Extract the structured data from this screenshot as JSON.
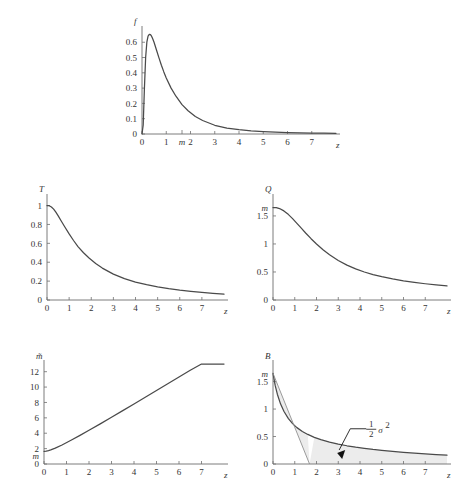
{
  "header": {
    "running_head": "",
    "page_number": ""
  },
  "figure": {
    "caption": "",
    "panels": [
      "f",
      "T",
      "Q",
      "m-bar",
      "B"
    ]
  },
  "chart_data": [
    {
      "type": "line",
      "id": "panel-f",
      "title": "",
      "ylabel": "f",
      "xlabel": "z",
      "xlim": [
        0,
        8
      ],
      "ylim": [
        0,
        0.68
      ],
      "grid": false,
      "legend": null,
      "xticks": [
        0,
        1,
        2,
        3,
        4,
        5,
        6,
        7
      ],
      "xticklabels": [
        "0",
        "1",
        "2",
        "3",
        "4",
        "5",
        "6",
        "7"
      ],
      "yticks": [
        0,
        0.1,
        0.2,
        0.3,
        0.4,
        0.5,
        0.6
      ],
      "yticklabels": [
        "0",
        "0.1",
        "0.2",
        "0.3",
        "0.4",
        "0.5",
        "0.6"
      ],
      "annotations": [
        {
          "text": "m",
          "x": 1.65,
          "y": 0,
          "place": "x-axis"
        }
      ],
      "series": [
        {
          "name": "f(z)",
          "x": [
            0.0,
            0.05,
            0.1,
            0.15,
            0.2,
            0.25,
            0.3,
            0.35,
            0.4,
            0.45,
            0.5,
            0.6,
            0.7,
            0.8,
            0.9,
            1.0,
            1.2,
            1.4,
            1.65,
            1.9,
            2.2,
            2.5,
            3.0,
            3.5,
            4.0,
            4.5,
            5.0,
            5.5,
            6.0,
            6.5,
            7.0,
            7.5,
            8.0
          ],
          "y": [
            0.0,
            0.06,
            0.3,
            0.5,
            0.6,
            0.64,
            0.652,
            0.65,
            0.638,
            0.62,
            0.598,
            0.548,
            0.498,
            0.45,
            0.406,
            0.366,
            0.3,
            0.247,
            0.192,
            0.152,
            0.114,
            0.088,
            0.057,
            0.039,
            0.028,
            0.021,
            0.016,
            0.012,
            0.0095,
            0.0076,
            0.0062,
            0.0051,
            0.0042
          ]
        }
      ]
    },
    {
      "type": "line",
      "id": "panel-T",
      "title": "",
      "ylabel": "T",
      "xlabel": "z",
      "xlim": [
        0,
        8
      ],
      "ylim": [
        0,
        1.08
      ],
      "grid": false,
      "legend": null,
      "xticks": [
        0,
        1,
        2,
        3,
        4,
        5,
        6,
        7
      ],
      "xticklabels": [
        "0",
        "1",
        "2",
        "3",
        "4",
        "5",
        "6",
        "7"
      ],
      "yticks": [
        0,
        0.2,
        0.4,
        0.6,
        0.8,
        1
      ],
      "yticklabels": [
        "0",
        "0.2",
        "0.4",
        "0.6",
        "0.8",
        "1"
      ],
      "annotations": [],
      "series": [
        {
          "name": "T(z)",
          "x": [
            0.0,
            0.1,
            0.2,
            0.3,
            0.4,
            0.5,
            0.65,
            0.8,
            1.0,
            1.2,
            1.4,
            1.65,
            1.9,
            2.2,
            2.5,
            3.0,
            3.5,
            4.0,
            4.5,
            5.0,
            5.5,
            6.0,
            6.5,
            7.0,
            7.5,
            8.0
          ],
          "y": [
            1.0,
            0.998,
            0.985,
            0.962,
            0.93,
            0.893,
            0.834,
            0.776,
            0.7,
            0.63,
            0.566,
            0.5,
            0.444,
            0.386,
            0.338,
            0.274,
            0.226,
            0.19,
            0.162,
            0.139,
            0.12,
            0.104,
            0.091,
            0.08,
            0.07,
            0.062
          ]
        }
      ]
    },
    {
      "type": "line",
      "id": "panel-Q",
      "title": "",
      "ylabel": "Q",
      "xlabel": "z",
      "xlim": [
        0,
        8
      ],
      "ylim": [
        0,
        1.82
      ],
      "grid": false,
      "legend": null,
      "xticks": [
        0,
        1,
        2,
        3,
        4,
        5,
        6,
        7
      ],
      "xticklabels": [
        "0",
        "1",
        "2",
        "3",
        "4",
        "5",
        "6",
        "7"
      ],
      "yticks": [
        0,
        0.5,
        1,
        1.5
      ],
      "yticklabels": [
        "0",
        "0.5",
        "1",
        "1.5"
      ],
      "annotations": [
        {
          "text": "m",
          "x": 0,
          "y": 1.65,
          "place": "y-axis"
        }
      ],
      "series": [
        {
          "name": "Q(z)",
          "x": [
            0.0,
            0.15,
            0.3,
            0.5,
            0.7,
            0.9,
            1.1,
            1.3,
            1.5,
            1.75,
            2.0,
            2.3,
            2.6,
            3.0,
            3.4,
            3.8,
            4.2,
            4.6,
            5.0,
            5.5,
            6.0,
            6.5,
            7.0,
            7.5,
            8.0
          ],
          "y": [
            1.65,
            1.648,
            1.632,
            1.59,
            1.528,
            1.452,
            1.368,
            1.282,
            1.196,
            1.094,
            1.0,
            0.896,
            0.806,
            0.704,
            0.622,
            0.556,
            0.5,
            0.454,
            0.416,
            0.375,
            0.342,
            0.314,
            0.29,
            0.27,
            0.252
          ]
        }
      ]
    },
    {
      "type": "line",
      "id": "panel-mbar",
      "title": "",
      "ylabel": "m̃",
      "xlabel": "z",
      "xlim": [
        0,
        8
      ],
      "ylim": [
        0,
        13
      ],
      "grid": false,
      "legend": null,
      "xticks": [
        0,
        1,
        2,
        3,
        4,
        5,
        6,
        7
      ],
      "xticklabels": [
        "0",
        "1",
        "2",
        "3",
        "4",
        "5",
        "6",
        "7"
      ],
      "yticks": [
        0,
        2,
        4,
        6,
        8,
        10,
        12
      ],
      "yticklabels": [
        "0",
        "2",
        "4",
        "6",
        "8",
        "10",
        "12"
      ],
      "annotations": [
        {
          "text": "m",
          "x": 0,
          "y": 1.65,
          "place": "y-axis"
        }
      ],
      "series": [
        {
          "name": "m̃(z)",
          "x": [
            0.0,
            0.1,
            0.2,
            0.3,
            0.5,
            0.8,
            1.2,
            1.6,
            2.0,
            2.5,
            3.0,
            3.5,
            4.0,
            4.5,
            5.0,
            5.5,
            6.0,
            6.5,
            7.0,
            7.5,
            8.0
          ],
          "y": [
            1.65,
            1.68,
            1.74,
            1.83,
            2.06,
            2.47,
            3.08,
            3.72,
            4.38,
            5.22,
            6.08,
            6.94,
            7.81,
            8.68,
            9.56,
            10.43,
            11.31,
            12.19,
            13.07,
            13.95,
            14.83
          ]
        }
      ]
    },
    {
      "type": "area",
      "id": "panel-B",
      "title": "",
      "ylabel": "B",
      "xlabel": "z",
      "xlim": [
        0,
        8
      ],
      "ylim": [
        0,
        1.82
      ],
      "grid": false,
      "legend": null,
      "xticks": [
        0,
        1,
        2,
        3,
        4,
        5,
        6,
        7
      ],
      "xticklabels": [
        "0",
        "1",
        "2",
        "3",
        "4",
        "5",
        "6",
        "7"
      ],
      "yticks": [
        0,
        0.5,
        1,
        1.5
      ],
      "yticklabels": [
        "0",
        "0.5",
        "1",
        "1.5"
      ],
      "annotations": [
        {
          "text": "m",
          "x": 0,
          "y": 1.65,
          "place": "y-axis"
        },
        {
          "text": "½σ²",
          "x": 3.0,
          "y": 0.55,
          "place": "callout",
          "arrow_to": [
            2.95,
            0.2
          ]
        }
      ],
      "series": [
        {
          "name": "B(z)",
          "x": [
            0.0,
            0.1,
            0.2,
            0.35,
            0.5,
            0.7,
            0.9,
            1.1,
            1.35,
            1.6,
            1.9,
            2.2,
            2.6,
            3.0,
            3.4,
            3.8,
            4.2,
            4.6,
            5.0,
            5.5,
            6.0,
            6.5,
            7.0,
            7.5,
            8.0
          ],
          "y": [
            1.65,
            1.43,
            1.27,
            1.09,
            0.96,
            0.83,
            0.735,
            0.662,
            0.592,
            0.538,
            0.484,
            0.442,
            0.398,
            0.362,
            0.332,
            0.306,
            0.284,
            0.264,
            0.248,
            0.228,
            0.212,
            0.196,
            0.184,
            0.172,
            0.162
          ]
        },
        {
          "name": "tangent",
          "x": [
            0.0,
            1.68
          ],
          "y": [
            1.65,
            0.0
          ]
        }
      ]
    }
  ]
}
